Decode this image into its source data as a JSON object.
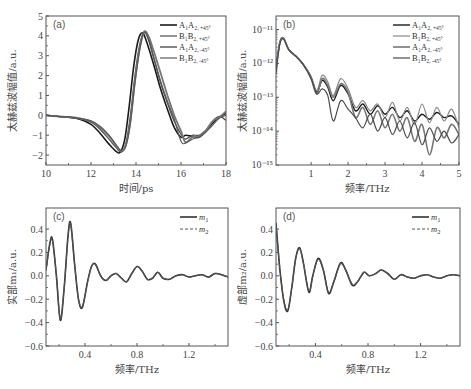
{
  "figure": {
    "width": 471,
    "height": 389
  },
  "chart_data": [
    {
      "id": "a",
      "type": "line",
      "panel_label": "(a)",
      "title": "",
      "xlabel": "时间/ps",
      "ylabel": "太赫兹波幅值/a.u.",
      "xlim": [
        10,
        18
      ],
      "ylim": [
        -2.5,
        5
      ],
      "xticks": [
        10,
        12,
        14,
        16,
        18
      ],
      "yticks": [
        -2,
        -1,
        0,
        1,
        2,
        3,
        4,
        5
      ],
      "xscale": "linear",
      "yscale": "linear",
      "grid": false,
      "legend_position": "upper right",
      "frame": {
        "x": 46,
        "y": 16,
        "w": 180,
        "h": 149
      },
      "series": [
        {
          "name": "A1A2,+45°",
          "label_main": "A₁A₂",
          "label_sub": ", +45°",
          "color": "#1a1a1a",
          "width": 1.6,
          "x": [
            10,
            10.5,
            11,
            11.5,
            12,
            12.4,
            12.8,
            13.1,
            13.3,
            13.5,
            13.7,
            13.9,
            14.1,
            14.3,
            14.5,
            14.8,
            15.1,
            15.4,
            15.7,
            16.0,
            16.2,
            16.5,
            16.8,
            17.1,
            17.4,
            17.7,
            18
          ],
          "y": [
            0,
            -0.05,
            -0.1,
            -0.2,
            -0.45,
            -0.9,
            -1.45,
            -1.8,
            -1.85,
            -1.2,
            0.5,
            2.5,
            3.8,
            4.15,
            3.6,
            2.5,
            1.3,
            0.3,
            -0.6,
            -1.1,
            -1.0,
            -1.05,
            -1.1,
            -0.8,
            -0.4,
            -0.1,
            0.1
          ]
        },
        {
          "name": "B1B2,+45°",
          "label_main": "B₁B₂",
          "label_sub": ", +45°",
          "color": "#4a4a4a",
          "width": 1.2,
          "x": [
            10,
            10.5,
            11,
            11.5,
            12,
            12.4,
            12.8,
            13.1,
            13.35,
            13.55,
            13.75,
            13.95,
            14.15,
            14.35,
            14.55,
            14.8,
            15.1,
            15.4,
            15.7,
            16.0,
            16.2,
            16.5,
            16.8,
            17.1,
            17.4,
            17.7,
            18
          ],
          "y": [
            0,
            -0.05,
            -0.1,
            -0.18,
            -0.35,
            -0.7,
            -1.2,
            -1.6,
            -1.85,
            -1.4,
            0.0,
            2.0,
            3.5,
            4.2,
            3.8,
            2.8,
            1.6,
            0.6,
            -0.3,
            -0.95,
            -1.2,
            -1.0,
            -1.0,
            -0.75,
            -0.3,
            -0.05,
            -0.25
          ]
        },
        {
          "name": "A1A2,-45°",
          "label_main": "A₁A₂",
          "label_sub": ", -45°",
          "color": "#777777",
          "width": 1.8,
          "x": [
            10,
            10.5,
            11,
            11.5,
            12,
            12.4,
            12.8,
            13.1,
            13.35,
            13.55,
            13.75,
            13.95,
            14.15,
            14.35,
            14.55,
            14.8,
            15.1,
            15.4,
            15.7,
            16.0,
            16.2,
            16.5,
            16.8,
            17.1,
            17.4,
            17.7,
            18
          ],
          "y": [
            0,
            -0.05,
            -0.08,
            -0.15,
            -0.3,
            -0.6,
            -1.05,
            -1.5,
            -1.8,
            -1.5,
            -0.3,
            1.7,
            3.3,
            4.2,
            4.0,
            3.2,
            2.1,
            1.0,
            0.0,
            -0.8,
            -1.35,
            -1.1,
            -1.05,
            -0.8,
            -0.3,
            -0.1,
            0.2
          ]
        },
        {
          "name": "B1B2,-45°",
          "label_main": "B₁B₂",
          "label_sub": ", -45°",
          "color": "#5a5a5a",
          "width": 1.2,
          "x": [
            10,
            10.5,
            11,
            11.5,
            12,
            12.4,
            12.8,
            13.1,
            13.35,
            13.55,
            13.75,
            13.95,
            14.15,
            14.35,
            14.55,
            14.8,
            15.1,
            15.4,
            15.7,
            16.0,
            16.2,
            16.5,
            16.8,
            17.1,
            17.4,
            17.7,
            18
          ],
          "y": [
            0,
            -0.05,
            -0.08,
            -0.15,
            -0.28,
            -0.55,
            -1.0,
            -1.45,
            -1.8,
            -1.55,
            -0.4,
            1.6,
            3.2,
            4.15,
            3.9,
            2.9,
            1.7,
            0.7,
            -0.2,
            -1.3,
            -1.4,
            -1.2,
            -1.1,
            -0.85,
            -0.5,
            -0.15,
            0.0
          ]
        }
      ]
    },
    {
      "id": "b",
      "type": "line",
      "panel_label": "(b)",
      "title": "",
      "xlabel": "频率/THz",
      "ylabel": "太赫兹波幅值/a.u.",
      "xlim": [
        0.05,
        5
      ],
      "ylim_log10": [
        -15,
        -10.6
      ],
      "xticks": [
        1,
        2,
        3,
        4,
        5
      ],
      "yticks_log10": [
        -11,
        -12,
        -13,
        -14,
        -15
      ],
      "ytick_labels": [
        "10⁻¹¹",
        "10⁻¹²",
        "10⁻¹³",
        "10⁻¹⁴",
        "10⁻¹⁵"
      ],
      "xscale": "linear",
      "yscale": "log",
      "grid": false,
      "legend_position": "upper right",
      "frame": {
        "x": 276,
        "y": 16,
        "w": 183,
        "h": 149
      },
      "series": [
        {
          "name": "A1A2,+45°",
          "label_main": "A₁A₂",
          "label_sub": ", +45°",
          "color": "#1a1a1a",
          "width": 1.4,
          "x": [
            0.05,
            0.15,
            0.25,
            0.4,
            0.6,
            0.8,
            1.0,
            1.15,
            1.3,
            1.45,
            1.6,
            1.8,
            2.0,
            2.2,
            2.4,
            2.6,
            2.8,
            3.0,
            3.2,
            3.4,
            3.6,
            3.8,
            4.0,
            4.2,
            4.4,
            4.6,
            4.8,
            5.0
          ],
          "y_log10": [
            -12.1,
            -11.4,
            -11.25,
            -11.6,
            -11.8,
            -12.05,
            -12.4,
            -12.85,
            -12.5,
            -12.7,
            -13.1,
            -12.65,
            -12.9,
            -13.4,
            -13.2,
            -13.5,
            -13.25,
            -13.5,
            -13.3,
            -13.6,
            -13.4,
            -13.7,
            -13.5,
            -13.65,
            -13.45,
            -13.6,
            -13.55,
            -13.8
          ]
        },
        {
          "name": "B1B2,+45°",
          "label_main": "B₁B₂",
          "label_sub": ", +45°",
          "color": "#888888",
          "width": 1.2,
          "x": [
            0.05,
            0.15,
            0.25,
            0.4,
            0.6,
            0.8,
            1.0,
            1.15,
            1.3,
            1.45,
            1.6,
            1.8,
            2.0,
            2.2,
            2.4,
            2.6,
            2.8,
            3.0,
            3.2,
            3.4,
            3.6,
            3.8,
            4.0,
            4.2,
            4.4,
            4.6,
            4.8,
            5.0
          ],
          "y_log10": [
            -12.2,
            -11.4,
            -11.25,
            -11.6,
            -11.8,
            -12.05,
            -12.4,
            -12.8,
            -12.35,
            -12.55,
            -12.95,
            -12.45,
            -12.75,
            -13.3,
            -13.1,
            -13.4,
            -13.2,
            -13.6,
            -13.15,
            -13.7,
            -13.3,
            -13.8,
            -13.2,
            -13.75,
            -13.3,
            -13.7,
            -13.35,
            -13.9
          ]
        },
        {
          "name": "A1A2,-45°",
          "label_main": "A₁A₂",
          "label_sub": ", -45°",
          "color": "#777777",
          "width": 1.6,
          "x": [
            0.05,
            0.15,
            0.25,
            0.4,
            0.6,
            0.8,
            1.0,
            1.15,
            1.3,
            1.45,
            1.6,
            1.8,
            2.0,
            2.2,
            2.4,
            2.6,
            2.8,
            3.0,
            3.2,
            3.4,
            3.6,
            3.8,
            4.0,
            4.2,
            4.4,
            4.6,
            4.8,
            5.0
          ],
          "y_log10": [
            -12.15,
            -11.4,
            -11.25,
            -11.6,
            -11.8,
            -12.05,
            -12.45,
            -12.9,
            -12.45,
            -12.65,
            -13.0,
            -12.6,
            -12.85,
            -13.6,
            -13.3,
            -13.8,
            -13.4,
            -13.9,
            -13.5,
            -14.0,
            -13.6,
            -14.3,
            -13.8,
            -14.7,
            -13.9,
            -14.2,
            -13.8,
            -14.1
          ]
        },
        {
          "name": "B1B2,-45°",
          "label_main": "B₁B₂",
          "label_sub": ", -45°",
          "color": "#4a4a4a",
          "width": 1.2,
          "x": [
            0.05,
            0.15,
            0.25,
            0.4,
            0.6,
            0.8,
            1.0,
            1.15,
            1.3,
            1.45,
            1.6,
            1.8,
            2.0,
            2.2,
            2.4,
            2.6,
            2.8,
            3.0,
            3.2,
            3.4,
            3.6,
            3.8,
            4.0,
            4.2,
            4.4,
            4.6,
            4.8,
            5.0
          ],
          "y_log10": [
            -12.3,
            -11.45,
            -11.28,
            -11.6,
            -11.8,
            -12.05,
            -12.45,
            -12.9,
            -12.75,
            -12.95,
            -13.7,
            -13.1,
            -13.35,
            -13.6,
            -13.9,
            -13.5,
            -14.0,
            -13.6,
            -14.1,
            -13.7,
            -14.2,
            -13.75,
            -14.4,
            -13.9,
            -14.3,
            -14.0,
            -14.35,
            -14.1
          ]
        }
      ]
    },
    {
      "id": "c",
      "type": "line",
      "panel_label": "(c)",
      "title": "",
      "xlabel": "频率/THz",
      "ylabel": "实部m₁/a.u.",
      "xlim": [
        0.1,
        1.5
      ],
      "ylim": [
        -0.6,
        0.58
      ],
      "xticks": [
        0.4,
        0.8,
        1.2
      ],
      "yticks": [
        -0.6,
        -0.4,
        -0.2,
        0.0,
        0.2,
        0.4
      ],
      "xscale": "linear",
      "yscale": "linear",
      "grid": false,
      "legend_position": "upper right",
      "frame": {
        "x": 46,
        "y": 208,
        "w": 182,
        "h": 138
      },
      "series": [
        {
          "name": "m1",
          "label_main": "m",
          "label_sub": "1",
          "color": "#333333",
          "width": 1.6,
          "dash": "",
          "x": [
            0.1,
            0.13,
            0.15,
            0.18,
            0.21,
            0.24,
            0.27,
            0.29,
            0.32,
            0.35,
            0.38,
            0.42,
            0.45,
            0.48,
            0.52,
            0.56,
            0.6,
            0.64,
            0.68,
            0.72,
            0.76,
            0.8,
            0.84,
            0.88,
            0.92,
            0.96,
            1.0,
            1.05,
            1.1,
            1.15,
            1.2,
            1.25,
            1.3,
            1.35,
            1.4,
            1.45,
            1.5
          ],
          "y": [
            0.05,
            0.28,
            0.31,
            0.0,
            -0.38,
            -0.1,
            0.35,
            0.45,
            0.1,
            -0.2,
            -0.27,
            -0.05,
            0.08,
            0.1,
            0.0,
            -0.04,
            0.0,
            0.02,
            -0.02,
            -0.05,
            0.02,
            0.08,
            0.04,
            -0.03,
            -0.02,
            0.03,
            -0.02,
            -0.03,
            0.0,
            0.01,
            -0.01,
            0.0,
            0.01,
            -0.01,
            0.02,
            0.01,
            -0.01
          ]
        },
        {
          "name": "m2",
          "label_main": "m",
          "label_sub": "2",
          "color": "#555555",
          "width": 1.2,
          "dash": "3,2",
          "x": [
            0.1,
            0.13,
            0.15,
            0.18,
            0.21,
            0.24,
            0.27,
            0.29,
            0.32,
            0.35,
            0.38,
            0.42,
            0.45,
            0.48,
            0.52,
            0.56,
            0.6,
            0.64,
            0.68,
            0.72,
            0.76,
            0.8,
            0.84,
            0.88,
            0.92,
            0.96,
            1.0,
            1.05,
            1.1,
            1.15,
            1.2,
            1.25,
            1.3,
            1.35,
            1.4,
            1.45,
            1.5
          ],
          "y": [
            0.05,
            0.27,
            0.3,
            0.0,
            -0.37,
            -0.1,
            0.34,
            0.44,
            0.1,
            -0.2,
            -0.26,
            -0.05,
            0.08,
            0.1,
            0.0,
            -0.04,
            0.0,
            0.02,
            -0.02,
            -0.05,
            0.02,
            0.08,
            0.04,
            -0.03,
            -0.02,
            0.03,
            -0.02,
            -0.03,
            0.0,
            0.01,
            -0.01,
            0.0,
            0.01,
            -0.01,
            0.02,
            0.01,
            -0.01
          ]
        }
      ]
    },
    {
      "id": "d",
      "type": "line",
      "panel_label": "(d)",
      "title": "",
      "xlabel": "频率/THz",
      "ylabel": "虚部m₂/a.u.",
      "xlim": [
        0.1,
        1.5
      ],
      "ylim": [
        -0.6,
        0.58
      ],
      "xticks": [
        0.4,
        0.8,
        1.2
      ],
      "yticks": [
        -0.6,
        -0.4,
        -0.2,
        0.0,
        0.2,
        0.4
      ],
      "xscale": "linear",
      "yscale": "linear",
      "grid": false,
      "legend_position": "upper right",
      "frame": {
        "x": 276,
        "y": 208,
        "w": 184,
        "h": 138
      },
      "series": [
        {
          "name": "m1",
          "label_main": "m",
          "label_sub": "1",
          "color": "#333333",
          "width": 1.6,
          "dash": "",
          "x": [
            0.1,
            0.13,
            0.16,
            0.19,
            0.22,
            0.25,
            0.28,
            0.31,
            0.35,
            0.38,
            0.42,
            0.46,
            0.5,
            0.54,
            0.59,
            0.63,
            0.68,
            0.72,
            0.77,
            0.81,
            0.86,
            0.9,
            0.95,
            1.0,
            1.05,
            1.1,
            1.15,
            1.2,
            1.25,
            1.3,
            1.35,
            1.4,
            1.45,
            1.5
          ],
          "y": [
            0.45,
            0.05,
            -0.22,
            -0.3,
            -0.1,
            0.15,
            0.24,
            0.1,
            -0.14,
            0.0,
            0.15,
            0.05,
            -0.15,
            -0.05,
            0.11,
            0.05,
            -0.08,
            -0.05,
            0.03,
            0.0,
            0.02,
            0.05,
            0.02,
            -0.03,
            0.01,
            -0.01,
            -0.02,
            0.0,
            0.01,
            -0.01,
            -0.02,
            0.0,
            0.01,
            0.0
          ]
        },
        {
          "name": "m2",
          "label_main": "m",
          "label_sub": "2",
          "color": "#555555",
          "width": 1.2,
          "dash": "3,2",
          "x": [
            0.1,
            0.13,
            0.16,
            0.19,
            0.22,
            0.25,
            0.28,
            0.31,
            0.35,
            0.38,
            0.42,
            0.46,
            0.5,
            0.54,
            0.59,
            0.63,
            0.68,
            0.72,
            0.77,
            0.81,
            0.86,
            0.9,
            0.95,
            1.0,
            1.05,
            1.1,
            1.15,
            1.2,
            1.25,
            1.3,
            1.35,
            1.4,
            1.45,
            1.5
          ],
          "y": [
            0.44,
            0.05,
            -0.21,
            -0.29,
            -0.1,
            0.15,
            0.23,
            0.1,
            -0.13,
            0.0,
            0.14,
            0.05,
            -0.14,
            -0.05,
            0.1,
            0.05,
            -0.07,
            -0.05,
            0.03,
            0.0,
            0.02,
            0.05,
            0.02,
            -0.03,
            0.01,
            -0.01,
            -0.02,
            0.0,
            0.01,
            -0.01,
            -0.02,
            0.0,
            0.01,
            0.0
          ]
        }
      ]
    }
  ]
}
